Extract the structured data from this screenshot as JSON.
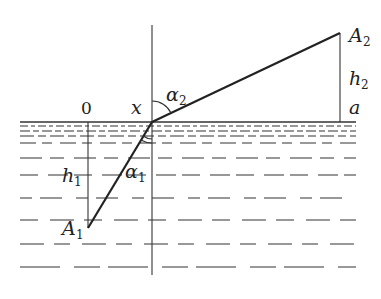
{
  "diagram": {
    "labels": {
      "origin": "0",
      "x": "x",
      "alpha2": "α",
      "alpha2_sub": "2",
      "alpha1": "α",
      "alpha1_sub": "1",
      "A1": "A",
      "A1_sub": "1",
      "A2": "A",
      "A2_sub": "2",
      "h1": "h",
      "h1_sub": "1",
      "h2": "h",
      "h2_sub": "2",
      "a": "a"
    },
    "points": {
      "refraction_point": [
        152,
        122
      ],
      "A1": [
        88,
        228
      ],
      "A2": [
        340,
        33
      ]
    },
    "colors": {
      "line": "#222222",
      "water": "#333333"
    }
  }
}
